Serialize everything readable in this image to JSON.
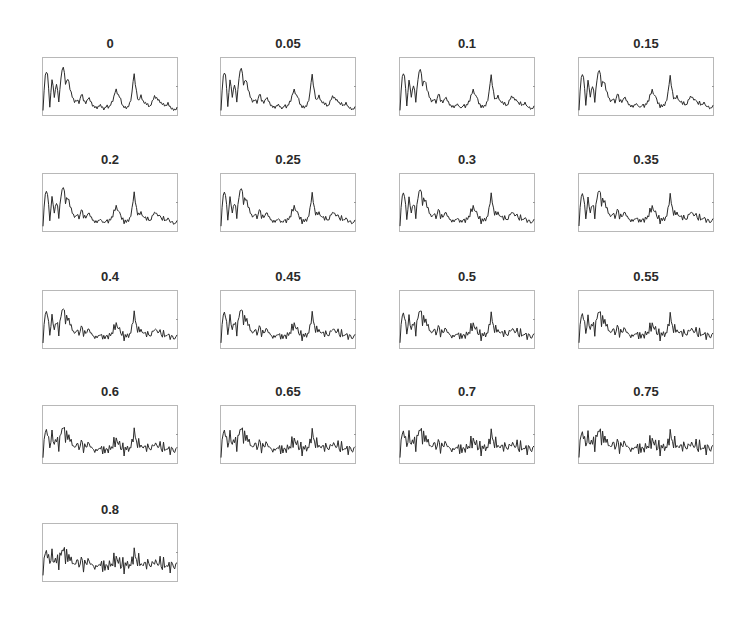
{
  "chart_data": {
    "type": "line",
    "layout": "small-multiples grid, 4 columns x 5 rows",
    "grid": false,
    "legend": null,
    "xlabel": "",
    "ylabel": "",
    "line_color": "#2b2b2b",
    "panels": [
      {
        "title": "0",
        "noise": 0.0
      },
      {
        "title": "0.05",
        "noise": 0.05
      },
      {
        "title": "0.1",
        "noise": 0.1
      },
      {
        "title": "0.15",
        "noise": 0.15
      },
      {
        "title": "0.2",
        "noise": 0.2
      },
      {
        "title": "0.25",
        "noise": 0.25
      },
      {
        "title": "0.3",
        "noise": 0.3
      },
      {
        "title": "0.35",
        "noise": 0.35
      },
      {
        "title": "0.4",
        "noise": 0.4
      },
      {
        "title": "0.45",
        "noise": 0.45
      },
      {
        "title": "0.5",
        "noise": 0.5
      },
      {
        "title": "0.55",
        "noise": 0.55
      },
      {
        "title": "0.6",
        "noise": 0.6
      },
      {
        "title": "0.65",
        "noise": 0.65
      },
      {
        "title": "0.7",
        "noise": 0.7
      },
      {
        "title": "0.75",
        "noise": 0.75
      },
      {
        "title": "0.8",
        "noise": 0.8
      }
    ],
    "base_signal": [
      0.05,
      0.78,
      0.8,
      0.1,
      0.7,
      0.3,
      0.6,
      0.2,
      0.75,
      0.95,
      0.55,
      0.7,
      0.45,
      0.3,
      0.2,
      0.25,
      0.18,
      0.4,
      0.22,
      0.18,
      0.3,
      0.22,
      0.12,
      0.1,
      0.08,
      0.15,
      0.1,
      0.05,
      0.14,
      0.08,
      0.18,
      0.25,
      0.48,
      0.35,
      0.3,
      0.12,
      0.1,
      0.08,
      0.15,
      0.3,
      0.82,
      0.45,
      0.2,
      0.35,
      0.22,
      0.18,
      0.16,
      0.1,
      0.2,
      0.32,
      0.28,
      0.24,
      0.18,
      0.16,
      0.12,
      0.18,
      0.1,
      0.06,
      0.04,
      0.08
    ],
    "noise_pattern": [
      0.2,
      0.6,
      0.3,
      0.8,
      0.1,
      0.5,
      0.9,
      0.3,
      0.7,
      0.2,
      0.4,
      0.8,
      0.1,
      0.6,
      0.3,
      0.9,
      0.2,
      0.7,
      0.4,
      0.5,
      0.1,
      0.8,
      0.3,
      0.6,
      0.2,
      0.9,
      0.4,
      0.1,
      0.7,
      0.3,
      0.5,
      0.8,
      0.2,
      0.6,
      0.9,
      0.3,
      0.1,
      0.7,
      0.4,
      0.5,
      0.8,
      0.2,
      0.6,
      0.3,
      0.9,
      0.4,
      0.1,
      0.7,
      0.5,
      0.2,
      0.8,
      0.3,
      0.6,
      0.1,
      0.9,
      0.4,
      0.7,
      0.2,
      0.5,
      0.8
    ]
  }
}
